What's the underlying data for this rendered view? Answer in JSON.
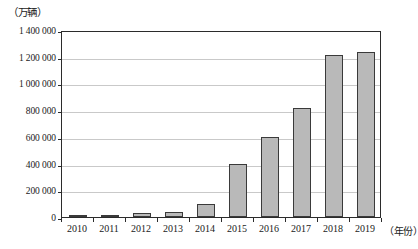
{
  "chart_data": {
    "type": "bar",
    "title": "",
    "subtitle": "",
    "xlabel": "（年份）",
    "ylabel": "（万辆）",
    "categories": [
      "2010",
      "2011",
      "2012",
      "2013",
      "2014",
      "2015",
      "2016",
      "2017",
      "2018",
      "2019"
    ],
    "values": [
      15000,
      12000,
      28000,
      38000,
      100000,
      400000,
      600000,
      815000,
      1215000,
      1235000
    ],
    "series": [
      {
        "name": "新能源汽车保有量",
        "values": [
          15000,
          12000,
          28000,
          38000,
          100000,
          400000,
          600000,
          815000,
          1215000,
          1235000
        ]
      }
    ],
    "ylim": [
      0,
      1400000
    ],
    "ytick_values": [
      0,
      200000,
      400000,
      600000,
      800000,
      1000000,
      1200000,
      1400000
    ],
    "ytick_labels": [
      "0",
      "200 000",
      "400 000",
      "600 000",
      "800 000",
      "1 000 000",
      "1 200 000",
      "1 400 000"
    ],
    "grid": "horizontal",
    "legend": "none",
    "bar_fill_color": "#b9b9b9",
    "bar_border_color": "#3a3a3a",
    "gridline_color": "#c9c9c9",
    "axis_color": "#2b2b2b",
    "background_color": "#ffffff"
  },
  "axes": {
    "y_unit_label": "（万辆）",
    "x_axis_title": "（年份）"
  }
}
